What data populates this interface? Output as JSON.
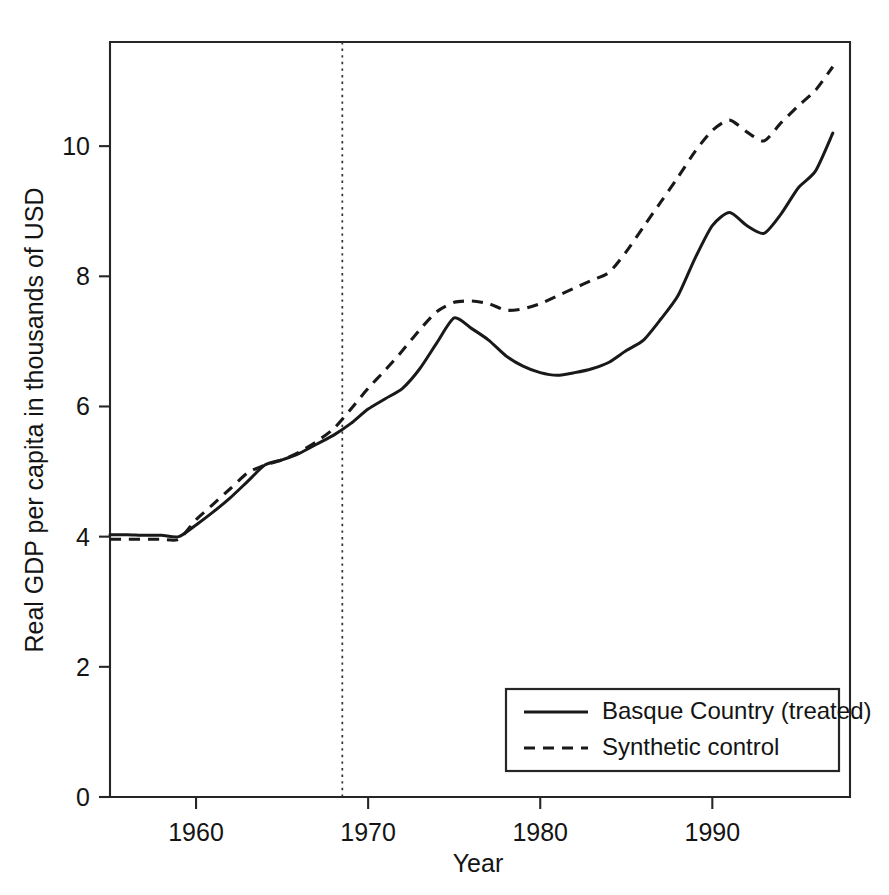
{
  "chart_data": {
    "type": "line",
    "title": "",
    "xlabel": "Year",
    "ylabel": "Real GDP per capita in thousands of USD",
    "xlim": [
      1955,
      1998
    ],
    "ylim": [
      0,
      11.6
    ],
    "xticks": [
      1960,
      1970,
      1980,
      1990
    ],
    "xticklabels": [
      "1960",
      "1970",
      "1980",
      "1990"
    ],
    "yticks": [
      0,
      2,
      4,
      6,
      8,
      10
    ],
    "yticklabels": [
      "0",
      "2",
      "4",
      "6",
      "8",
      "10"
    ],
    "grid": false,
    "legend_position": "lower-right",
    "annotations": [
      {
        "name": "treatment-year-line",
        "type": "vertical-dashed-line",
        "x": 1968.5,
        "label": ""
      }
    ],
    "x": [
      1955,
      1956,
      1957,
      1958,
      1959,
      1960,
      1961,
      1962,
      1963,
      1964,
      1965,
      1966,
      1967,
      1968,
      1969,
      1970,
      1971,
      1972,
      1973,
      1974,
      1975,
      1976,
      1977,
      1978,
      1979,
      1980,
      1981,
      1982,
      1983,
      1984,
      1985,
      1986,
      1987,
      1988,
      1989,
      1990,
      1991,
      1992,
      1993,
      1994,
      1995,
      1996,
      1997
    ],
    "series": [
      {
        "name": "Basque Country (treated)",
        "style": "solid",
        "color": "#191919",
        "values": [
          4.03,
          4.03,
          4.02,
          4.02,
          4.0,
          4.18,
          4.38,
          4.6,
          4.85,
          5.1,
          5.18,
          5.28,
          5.42,
          5.56,
          5.74,
          5.96,
          6.12,
          6.28,
          6.58,
          6.98,
          7.36,
          7.2,
          7.02,
          6.78,
          6.62,
          6.52,
          6.48,
          6.52,
          6.58,
          6.68,
          6.86,
          7.02,
          7.34,
          7.7,
          8.28,
          8.78,
          8.98,
          8.78,
          8.66,
          8.96,
          9.36,
          9.62,
          10.2
        ]
      },
      {
        "name": "Synthetic control",
        "style": "dashed",
        "color": "#191919",
        "values": [
          3.96,
          3.96,
          3.96,
          3.96,
          3.96,
          4.26,
          4.5,
          4.74,
          4.98,
          5.1,
          5.18,
          5.3,
          5.46,
          5.66,
          5.96,
          6.28,
          6.56,
          6.86,
          7.18,
          7.46,
          7.6,
          7.62,
          7.58,
          7.48,
          7.5,
          7.58,
          7.7,
          7.82,
          7.94,
          8.06,
          8.38,
          8.76,
          9.14,
          9.52,
          9.92,
          10.24,
          10.4,
          10.22,
          10.08,
          10.36,
          10.62,
          10.86,
          11.22
        ]
      }
    ]
  },
  "legend": {
    "items": [
      {
        "label": "Basque Country (treated)",
        "style": "solid"
      },
      {
        "label": "Synthetic control",
        "style": "dashed"
      }
    ]
  }
}
